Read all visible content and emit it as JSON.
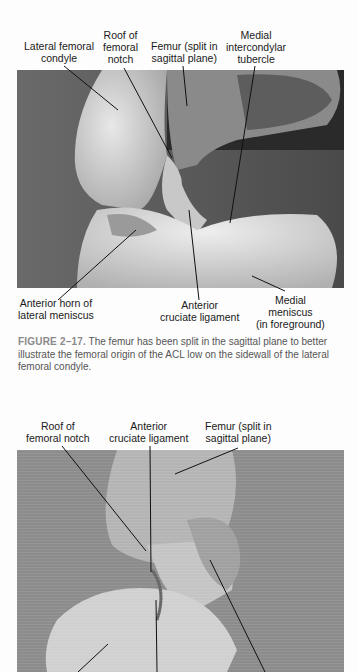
{
  "figure1": {
    "labels_top": [
      {
        "id": "lateral-femoral-condyle",
        "text": "Lateral femoral\ncondyle"
      },
      {
        "id": "roof-femoral-notch",
        "text": "Roof of\nfemoral\nnotch"
      },
      {
        "id": "femur-split",
        "text": "Femur (split in\nsagittal plane)"
      },
      {
        "id": "medial-intercondylar-tubercle",
        "text": "Medial\nintercondylar\ntubercle"
      }
    ],
    "labels_bottom": [
      {
        "id": "anterior-horn-lateral-meniscus",
        "text": "Anterior horn of\nlateral meniscus"
      },
      {
        "id": "anterior-cruciate-ligament",
        "text": "Anterior\ncruciate ligament"
      },
      {
        "id": "medial-meniscus",
        "text": "Medial\nmeniscus\n(in foreground)"
      }
    ],
    "caption_number": "FIGURE 2–17.",
    "caption_text": "The femur has been split in the sagittal plane to better illustrate the femoral origin of the ACL low on the sidewall of the lateral femoral condyle."
  },
  "figure2": {
    "labels_top": [
      {
        "id": "roof-femoral-notch",
        "text": "Roof of\nfemoral notch"
      },
      {
        "id": "anterior-cruciate-ligament",
        "text": "Anterior\ncruciate ligament"
      },
      {
        "id": "femur-split",
        "text": "Femur (split in\nsagittal plane)"
      }
    ]
  }
}
